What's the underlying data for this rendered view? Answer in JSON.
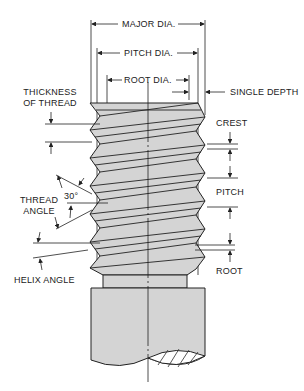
{
  "diagram": {
    "labels": {
      "major_dia": "MAJOR DIA.",
      "pitch_dia": "PITCH DIA.",
      "root_dia": "ROOT DIA.",
      "single_depth": "SINGLE DEPTH",
      "thickness_line1": "THICKNESS",
      "thickness_line2": "OF THREAD",
      "crest": "CREST",
      "pitch": "PITCH",
      "root": "ROOT",
      "thread_angle_line1": "THREAD",
      "thread_angle_line2": "ANGLE",
      "angle_value": "30°",
      "helix_angle": "HELIX ANGLE"
    },
    "colors": {
      "fill": "#d4d4d4",
      "line": "#222222",
      "hatch": "#444444"
    }
  }
}
